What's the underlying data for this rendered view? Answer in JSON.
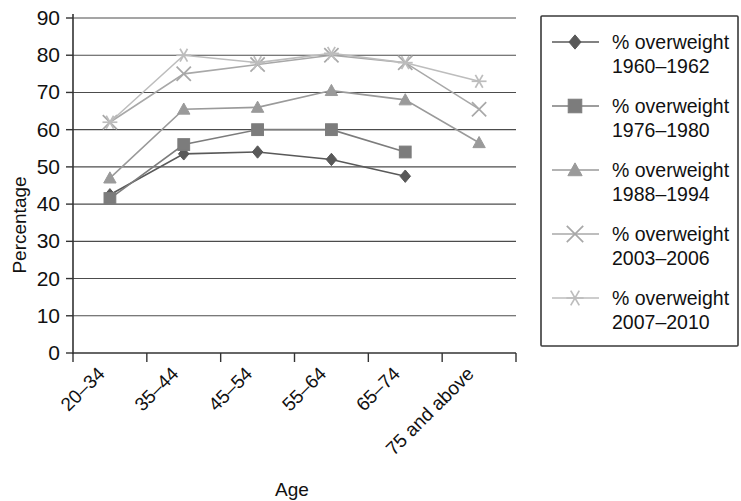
{
  "chart_data": {
    "type": "line",
    "title": "",
    "xlabel": "Age",
    "ylabel": "Percentage",
    "categories": [
      "20–34",
      "35–44",
      "45–54",
      "55–64",
      "65–74",
      "75 and above"
    ],
    "ylim": [
      0,
      90
    ],
    "ytick_labels": [
      "0",
      "10",
      "20",
      "30",
      "40",
      "50",
      "60",
      "70",
      "80",
      "90"
    ],
    "ytick_values": [
      0,
      10,
      20,
      30,
      40,
      50,
      60,
      70,
      80,
      90
    ],
    "grid": true,
    "legend_position": "right",
    "series": [
      {
        "name": "% overweight 1960–1962",
        "legend_line1": "% overweight",
        "legend_line2": "1960–1962",
        "marker": "diamond",
        "color": "#595959",
        "values": [
          42.5,
          53.5,
          54,
          52,
          47.5,
          null
        ]
      },
      {
        "name": "% overweight 1976–1980",
        "legend_line1": "% overweight",
        "legend_line2": "1976–1980",
        "marker": "square",
        "color": "#7c7c7c",
        "values": [
          41.5,
          56,
          60,
          60,
          54,
          null
        ]
      },
      {
        "name": "% overweight 1988–1994",
        "legend_line1": "% overweight",
        "legend_line2": "1988–1994",
        "marker": "triangle",
        "color": "#9a9a9a",
        "values": [
          47,
          65.5,
          66,
          70.5,
          68,
          56.5
        ]
      },
      {
        "name": "% overweight 2003–2006",
        "legend_line1": "% overweight",
        "legend_line2": "2003–2006",
        "marker": "x",
        "color": "#a8a8a8",
        "values": [
          62,
          75,
          77.5,
          80,
          78,
          65.5
        ]
      },
      {
        "name": "% overweight 2007–2010",
        "legend_line1": "% overweight",
        "legend_line2": "2007–2010",
        "marker": "asterisk",
        "color": "#bdbdbd",
        "values": [
          62,
          80,
          78,
          80.5,
          78,
          73
        ]
      }
    ]
  }
}
